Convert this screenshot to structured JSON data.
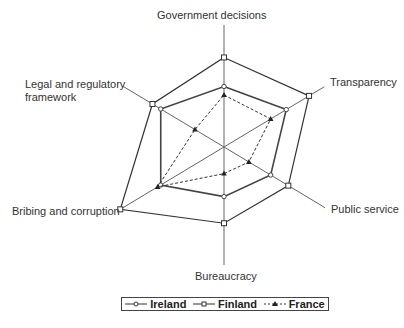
{
  "chart_data": {
    "type": "radar",
    "title": "",
    "axes": [
      "Government decisions",
      "Transparency",
      "Public service",
      "Bureaucracy",
      "Bribing and corruption",
      "Legal and regulatory framework"
    ],
    "range": [
      0,
      100
    ],
    "series": [
      {
        "name": "Ireland",
        "marker": "circle",
        "line": "solid",
        "values": [
          50,
          60,
          45,
          41,
          61,
          61
        ]
      },
      {
        "name": "Finland",
        "marker": "square",
        "line": "solid",
        "values": [
          74,
          82,
          62,
          63,
          100,
          69
        ]
      },
      {
        "name": "France",
        "marker": "triangle",
        "line": "dashed",
        "values": [
          43,
          45,
          24,
          22,
          64,
          28
        ]
      }
    ],
    "legend_position": "bottom",
    "grid": false
  },
  "labels": {
    "gov": "Government decisions",
    "transparency": "Transparency",
    "public": "Public service",
    "bureaucracy": "Bureaucracy",
    "bribing": "Bribing and corruption",
    "legal1": "Legal and regulatory",
    "legal2": "framework"
  },
  "legend": {
    "ireland": "Ireland",
    "finland": "Finland",
    "france": "France"
  }
}
